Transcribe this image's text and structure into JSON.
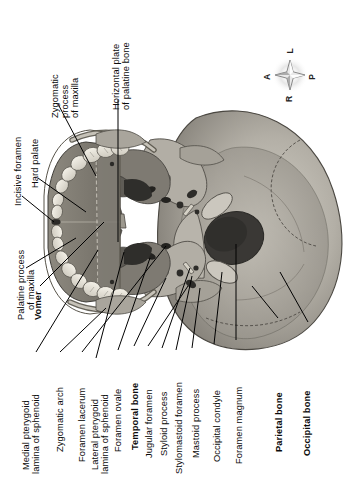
{
  "figure": {
    "orientation_compass": {
      "name": "anatomical-orientation-rose",
      "top": "L",
      "right": "P",
      "bottom": "R",
      "left": "A"
    },
    "background_color": "#ffffff",
    "ink_color": "#0b0b0b",
    "bone_light": "#c9c6bd",
    "bone_mid": "#9b978e",
    "bone_dark": "#6d6a63",
    "cavity_dark": "#3c3a37",
    "tooth_color": "#efece3"
  },
  "labels": [
    {
      "id": "incisive-foramen",
      "text": "Incisive foramen",
      "line2": "",
      "bold": false
    },
    {
      "id": "hard-palate",
      "text": "Hard palate",
      "line2": "",
      "bold": false
    },
    {
      "id": "zygomatic-process-maxilla",
      "text": "Zygomatic",
      "line2": "process",
      "line3": "of maxilla",
      "bold": false
    },
    {
      "id": "horizontal-plate-palatine",
      "text": "Horizontal plate",
      "line2": "of palatine bone",
      "bold": false
    },
    {
      "id": "palatine-process-maxilla",
      "text": "Palatine process",
      "line2": "of maxilla",
      "bold": false
    },
    {
      "id": "vomer",
      "text": "Vomer",
      "line2": "",
      "bold": true
    },
    {
      "id": "medial-pterygoid-lamina",
      "text": "Medial pterygoid",
      "line2": "lamina of sphenoid",
      "bold": false
    },
    {
      "id": "zygomatic-arch",
      "text": "Zygomatic arch",
      "line2": "",
      "bold": false
    },
    {
      "id": "foramen-lacerum",
      "text": "Foramen lacerum",
      "line2": "",
      "bold": false
    },
    {
      "id": "lateral-pterygoid-lamina",
      "text": "Lateral pterygoid",
      "line2": "lamina of sphenoid",
      "bold": false
    },
    {
      "id": "foramen-ovale",
      "text": "Foramen ovale",
      "line2": "",
      "bold": false
    },
    {
      "id": "temporal-bone",
      "text": "Temporal bone",
      "line2": "",
      "bold": true
    },
    {
      "id": "jugular-foramen",
      "text": "Jugular foramen",
      "line2": "",
      "bold": false
    },
    {
      "id": "styloid-process",
      "text": "Styloid process",
      "line2": "",
      "bold": false
    },
    {
      "id": "stylomastoid-foramen",
      "text": "Stylomastoid foramen",
      "line2": "",
      "bold": false
    },
    {
      "id": "mastoid-process",
      "text": "Mastoid process",
      "line2": "",
      "bold": false
    },
    {
      "id": "occipital-condyle",
      "text": "Occipital condyle",
      "line2": "",
      "bold": false
    },
    {
      "id": "foramen-magnum",
      "text": "Foramen magnum",
      "line2": "",
      "bold": false
    },
    {
      "id": "parietal-bone",
      "text": "Parietal bone",
      "line2": "",
      "bold": true
    },
    {
      "id": "occipital-bone",
      "text": "Occipital bone",
      "line2": "",
      "bold": true
    }
  ]
}
